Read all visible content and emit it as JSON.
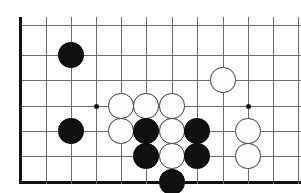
{
  "board": {
    "title": "Go board position",
    "game": "Go (Weiqi/Baduk)",
    "view": "bottom-left corner region",
    "colors": {
      "background": "#ffffff",
      "grid_line": "#6b6b6b",
      "edge_line": "#111111",
      "black_stone": "#101010",
      "white_stone": "#fdfdfd",
      "white_stone_outline": "#3a3a3a",
      "hoshi": "#111111"
    },
    "geometry": {
      "width": 301,
      "height": 193,
      "cell_size": 25.3,
      "stone_radius": 12.6,
      "vertical_lines_x": [
        21,
        46,
        71,
        96,
        121,
        146,
        172,
        197,
        223,
        248,
        273,
        298
      ],
      "horizontal_lines_y": [
        25,
        55,
        80,
        106,
        131,
        156,
        182
      ],
      "left_edge_x": 21,
      "bottom_edge_y": 182
    },
    "hoshi_points": [
      {
        "name": "hoshi-left",
        "x": 96,
        "y": 106
      },
      {
        "name": "hoshi-right",
        "x": 248,
        "y": 106
      }
    ],
    "stones": [
      {
        "id": "b1",
        "color": "black",
        "x": 71,
        "y": 55
      },
      {
        "id": "w1",
        "color": "white",
        "x": 223,
        "y": 80
      },
      {
        "id": "w2",
        "color": "white",
        "x": 121,
        "y": 106
      },
      {
        "id": "w3",
        "color": "white",
        "x": 146,
        "y": 106
      },
      {
        "id": "w4",
        "color": "white",
        "x": 172,
        "y": 106
      },
      {
        "id": "b2",
        "color": "black",
        "x": 71,
        "y": 131
      },
      {
        "id": "w5",
        "color": "white",
        "x": 121,
        "y": 131
      },
      {
        "id": "b3",
        "color": "black",
        "x": 146,
        "y": 131
      },
      {
        "id": "w6",
        "color": "white",
        "x": 172,
        "y": 131
      },
      {
        "id": "b4",
        "color": "black",
        "x": 197,
        "y": 131
      },
      {
        "id": "w7",
        "color": "white",
        "x": 248,
        "y": 131
      },
      {
        "id": "b5",
        "color": "black",
        "x": 146,
        "y": 156
      },
      {
        "id": "w8",
        "color": "white",
        "x": 172,
        "y": 156
      },
      {
        "id": "b6",
        "color": "black",
        "x": 197,
        "y": 156
      },
      {
        "id": "w9",
        "color": "white",
        "x": 248,
        "y": 156
      },
      {
        "id": "b7",
        "color": "black",
        "x": 172,
        "y": 182
      }
    ],
    "counts": {
      "black_stones": 7,
      "white_stones": 9,
      "total_stones": 16
    }
  }
}
